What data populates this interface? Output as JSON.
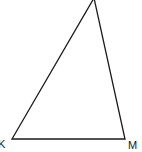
{
  "diagram": {
    "type": "triangle",
    "vertices": [
      {
        "label": "K",
        "x": 12,
        "y": 139
      },
      {
        "label": "M",
        "x": 125,
        "y": 139
      },
      {
        "label": "",
        "x": 94,
        "y": -2
      }
    ],
    "labels": {
      "k": "K",
      "m": "M"
    },
    "stroke_color": "#1a1a1a",
    "background": "#ffffff"
  }
}
